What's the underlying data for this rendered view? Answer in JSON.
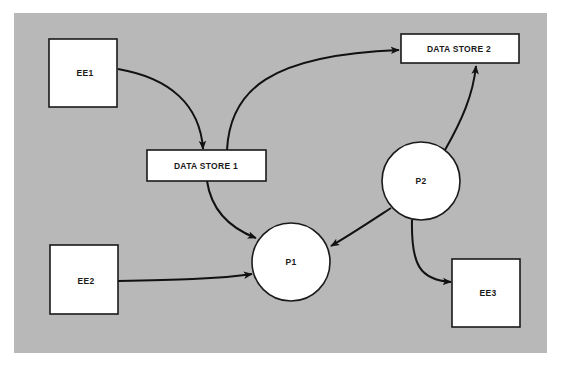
{
  "diagram": {
    "type": "data-flow-diagram",
    "background_color": "#b8b8b8",
    "nodes": {
      "ee1": {
        "label": "EE1",
        "shape": "square"
      },
      "ee2": {
        "label": "EE2",
        "shape": "square"
      },
      "ee3": {
        "label": "EE3",
        "shape": "square"
      },
      "ds1": {
        "label": "DATA STORE 1",
        "shape": "rectangle"
      },
      "ds2": {
        "label": "DATA STORE 2",
        "shape": "rectangle"
      },
      "p1": {
        "label": "P1",
        "shape": "circle"
      },
      "p2": {
        "label": "P2",
        "shape": "circle"
      }
    },
    "edges": [
      {
        "from": "EE1",
        "to": "DATA STORE 1"
      },
      {
        "from": "DATA STORE 1",
        "to": "DATA STORE 2"
      },
      {
        "from": "DATA STORE 1",
        "to": "P1"
      },
      {
        "from": "EE2",
        "to": "P1"
      },
      {
        "from": "P2",
        "to": "P1"
      },
      {
        "from": "P2",
        "to": "DATA STORE 2"
      },
      {
        "from": "P2",
        "to": "EE3"
      }
    ]
  }
}
